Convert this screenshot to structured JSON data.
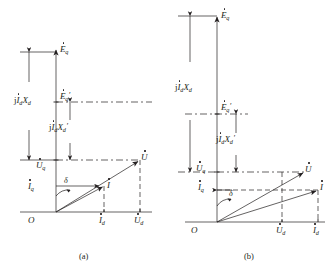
{
  "figure": {
    "type": "phasor-diagram",
    "stroke_color": "#231f20",
    "background": "#ffffff"
  },
  "panels": [
    {
      "id": "a",
      "caption": "(a)",
      "labels": {
        "eq": "E",
        "eq_sub": "q",
        "eq_prime": "E",
        "eq_prime_sub": "q",
        "eq_prime_mark": "′",
        "jidxd": "j",
        "jidxd_i": "I",
        "jidxd_isub": "d",
        "jidxd_x": "X",
        "jidxd_xsub": "d",
        "jidxd_prime": "j",
        "jidxd_prime_i": "I",
        "jidxd_prime_isub": "d",
        "jidxd_prime_x": "X",
        "jidxd_prime_xsub": "d",
        "jidxd_prime_mark": "′",
        "uq": "U",
        "uq_sub": "q",
        "iq": "I",
        "iq_sub": "q",
        "delta": "δ",
        "i": "I",
        "u": "U",
        "origin": "O",
        "id": "I",
        "id_sub": "d",
        "ud": "U",
        "ud_sub": "d"
      }
    },
    {
      "id": "b",
      "caption": "(b)",
      "labels": {
        "eq": "E",
        "eq_sub": "q",
        "eq_prime": "E",
        "eq_prime_sub": "q",
        "eq_prime_mark": "′",
        "jidxd": "j",
        "jidxd_i": "I",
        "jidxd_isub": "d",
        "jidxd_x": "X",
        "jidxd_xsub": "d",
        "jidxd_prime": "j",
        "jidxd_prime_i": "I",
        "jidxd_prime_isub": "d",
        "jidxd_prime_x": "X",
        "jidxd_prime_xsub": "d",
        "jidxd_prime_mark": "′",
        "uq": "U",
        "uq_sub": "q",
        "iq": "I",
        "iq_sub": "q",
        "delta": "δ",
        "i": "I",
        "u": "U",
        "origin": "O",
        "ud": "U",
        "ud_sub": "d",
        "id": "I",
        "id_sub": "d"
      }
    }
  ]
}
